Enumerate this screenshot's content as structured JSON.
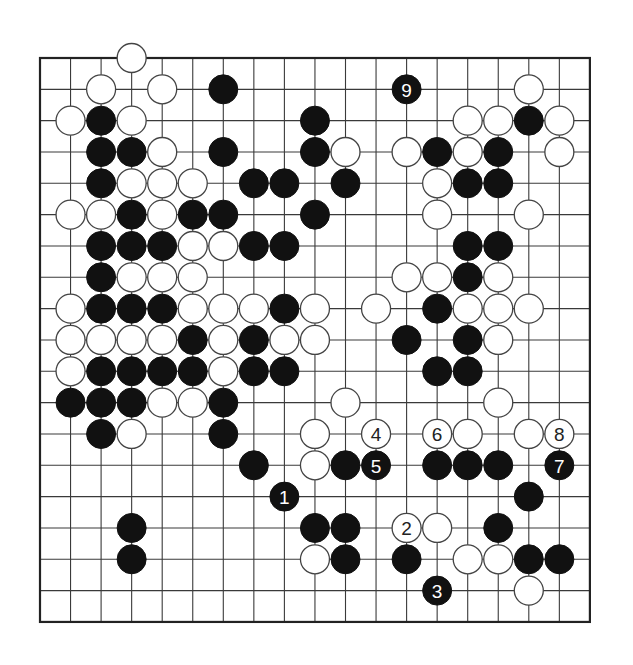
{
  "board": {
    "size": 19,
    "origin_x": 40,
    "origin_y": 58,
    "spacing_x": 30.55,
    "spacing_y": 31.33,
    "stone_radius": 14.5,
    "colors": {
      "black": "#111111",
      "white": "#ffffff",
      "line": "#3a3a3a"
    }
  },
  "stones": [
    {
      "row": 0,
      "col": 3,
      "color": "white"
    },
    {
      "row": 1,
      "col": 2,
      "color": "white"
    },
    {
      "row": 1,
      "col": 4,
      "color": "white"
    },
    {
      "row": 1,
      "col": 6,
      "color": "black"
    },
    {
      "row": 1,
      "col": 12,
      "color": "black",
      "label": "9"
    },
    {
      "row": 1,
      "col": 16,
      "color": "white"
    },
    {
      "row": 2,
      "col": 1,
      "color": "white"
    },
    {
      "row": 2,
      "col": 2,
      "color": "black"
    },
    {
      "row": 2,
      "col": 3,
      "color": "white"
    },
    {
      "row": 2,
      "col": 9,
      "color": "black"
    },
    {
      "row": 2,
      "col": 14,
      "color": "white"
    },
    {
      "row": 2,
      "col": 15,
      "color": "white"
    },
    {
      "row": 2,
      "col": 16,
      "color": "black"
    },
    {
      "row": 2,
      "col": 17,
      "color": "white"
    },
    {
      "row": 3,
      "col": 2,
      "color": "black"
    },
    {
      "row": 3,
      "col": 3,
      "color": "black"
    },
    {
      "row": 3,
      "col": 4,
      "color": "white"
    },
    {
      "row": 3,
      "col": 6,
      "color": "black"
    },
    {
      "row": 3,
      "col": 9,
      "color": "black"
    },
    {
      "row": 3,
      "col": 10,
      "color": "white"
    },
    {
      "row": 3,
      "col": 12,
      "color": "white"
    },
    {
      "row": 3,
      "col": 13,
      "color": "black"
    },
    {
      "row": 3,
      "col": 14,
      "color": "white"
    },
    {
      "row": 3,
      "col": 15,
      "color": "black"
    },
    {
      "row": 3,
      "col": 17,
      "color": "white"
    },
    {
      "row": 4,
      "col": 2,
      "color": "black"
    },
    {
      "row": 4,
      "col": 3,
      "color": "white"
    },
    {
      "row": 4,
      "col": 4,
      "color": "white"
    },
    {
      "row": 4,
      "col": 5,
      "color": "white"
    },
    {
      "row": 4,
      "col": 7,
      "color": "black"
    },
    {
      "row": 4,
      "col": 8,
      "color": "black"
    },
    {
      "row": 4,
      "col": 10,
      "color": "black"
    },
    {
      "row": 4,
      "col": 13,
      "color": "white"
    },
    {
      "row": 4,
      "col": 14,
      "color": "black"
    },
    {
      "row": 4,
      "col": 15,
      "color": "black"
    },
    {
      "row": 5,
      "col": 1,
      "color": "white"
    },
    {
      "row": 5,
      "col": 2,
      "color": "white"
    },
    {
      "row": 5,
      "col": 3,
      "color": "black"
    },
    {
      "row": 5,
      "col": 4,
      "color": "white"
    },
    {
      "row": 5,
      "col": 5,
      "color": "black"
    },
    {
      "row": 5,
      "col": 6,
      "color": "black"
    },
    {
      "row": 5,
      "col": 9,
      "color": "black"
    },
    {
      "row": 5,
      "col": 13,
      "color": "white"
    },
    {
      "row": 5,
      "col": 16,
      "color": "white"
    },
    {
      "row": 6,
      "col": 2,
      "color": "black"
    },
    {
      "row": 6,
      "col": 3,
      "color": "black"
    },
    {
      "row": 6,
      "col": 4,
      "color": "black"
    },
    {
      "row": 6,
      "col": 5,
      "color": "white"
    },
    {
      "row": 6,
      "col": 6,
      "color": "white"
    },
    {
      "row": 6,
      "col": 7,
      "color": "black"
    },
    {
      "row": 6,
      "col": 8,
      "color": "black"
    },
    {
      "row": 6,
      "col": 14,
      "color": "black"
    },
    {
      "row": 6,
      "col": 15,
      "color": "black"
    },
    {
      "row": 7,
      "col": 2,
      "color": "black"
    },
    {
      "row": 7,
      "col": 3,
      "color": "white"
    },
    {
      "row": 7,
      "col": 4,
      "color": "white"
    },
    {
      "row": 7,
      "col": 5,
      "color": "white"
    },
    {
      "row": 7,
      "col": 12,
      "color": "white"
    },
    {
      "row": 7,
      "col": 13,
      "color": "white"
    },
    {
      "row": 7,
      "col": 14,
      "color": "black"
    },
    {
      "row": 7,
      "col": 15,
      "color": "white"
    },
    {
      "row": 8,
      "col": 1,
      "color": "white"
    },
    {
      "row": 8,
      "col": 2,
      "color": "black"
    },
    {
      "row": 8,
      "col": 3,
      "color": "black"
    },
    {
      "row": 8,
      "col": 4,
      "color": "black"
    },
    {
      "row": 8,
      "col": 5,
      "color": "white"
    },
    {
      "row": 8,
      "col": 6,
      "color": "white"
    },
    {
      "row": 8,
      "col": 7,
      "color": "white"
    },
    {
      "row": 8,
      "col": 8,
      "color": "black"
    },
    {
      "row": 8,
      "col": 9,
      "color": "white"
    },
    {
      "row": 8,
      "col": 11,
      "color": "white"
    },
    {
      "row": 8,
      "col": 13,
      "color": "black"
    },
    {
      "row": 8,
      "col": 14,
      "color": "white"
    },
    {
      "row": 8,
      "col": 15,
      "color": "white"
    },
    {
      "row": 8,
      "col": 16,
      "color": "white"
    },
    {
      "row": 9,
      "col": 1,
      "color": "white"
    },
    {
      "row": 9,
      "col": 2,
      "color": "white"
    },
    {
      "row": 9,
      "col": 3,
      "color": "white"
    },
    {
      "row": 9,
      "col": 4,
      "color": "white"
    },
    {
      "row": 9,
      "col": 5,
      "color": "black"
    },
    {
      "row": 9,
      "col": 6,
      "color": "white"
    },
    {
      "row": 9,
      "col": 7,
      "color": "black"
    },
    {
      "row": 9,
      "col": 8,
      "color": "white"
    },
    {
      "row": 9,
      "col": 9,
      "color": "white"
    },
    {
      "row": 9,
      "col": 12,
      "color": "black"
    },
    {
      "row": 9,
      "col": 14,
      "color": "black"
    },
    {
      "row": 9,
      "col": 15,
      "color": "white"
    },
    {
      "row": 10,
      "col": 1,
      "color": "white"
    },
    {
      "row": 10,
      "col": 2,
      "color": "black"
    },
    {
      "row": 10,
      "col": 3,
      "color": "black"
    },
    {
      "row": 10,
      "col": 4,
      "color": "black"
    },
    {
      "row": 10,
      "col": 5,
      "color": "black"
    },
    {
      "row": 10,
      "col": 6,
      "color": "white"
    },
    {
      "row": 10,
      "col": 7,
      "color": "black"
    },
    {
      "row": 10,
      "col": 8,
      "color": "black"
    },
    {
      "row": 10,
      "col": 13,
      "color": "black"
    },
    {
      "row": 10,
      "col": 14,
      "color": "black"
    },
    {
      "row": 11,
      "col": 1,
      "color": "black"
    },
    {
      "row": 11,
      "col": 2,
      "color": "black"
    },
    {
      "row": 11,
      "col": 3,
      "color": "black"
    },
    {
      "row": 11,
      "col": 4,
      "color": "white"
    },
    {
      "row": 11,
      "col": 5,
      "color": "white"
    },
    {
      "row": 11,
      "col": 6,
      "color": "black"
    },
    {
      "row": 11,
      "col": 10,
      "color": "white"
    },
    {
      "row": 11,
      "col": 15,
      "color": "white"
    },
    {
      "row": 12,
      "col": 2,
      "color": "black"
    },
    {
      "row": 12,
      "col": 3,
      "color": "white"
    },
    {
      "row": 12,
      "col": 6,
      "color": "black"
    },
    {
      "row": 12,
      "col": 9,
      "color": "white"
    },
    {
      "row": 12,
      "col": 11,
      "color": "white",
      "label": "4"
    },
    {
      "row": 12,
      "col": 13,
      "color": "white",
      "label": "6"
    },
    {
      "row": 12,
      "col": 14,
      "color": "white"
    },
    {
      "row": 12,
      "col": 16,
      "color": "white"
    },
    {
      "row": 12,
      "col": 17,
      "color": "white",
      "label": "8"
    },
    {
      "row": 13,
      "col": 7,
      "color": "black"
    },
    {
      "row": 13,
      "col": 9,
      "color": "white"
    },
    {
      "row": 13,
      "col": 10,
      "color": "black"
    },
    {
      "row": 13,
      "col": 11,
      "color": "black",
      "label": "5"
    },
    {
      "row": 13,
      "col": 13,
      "color": "black"
    },
    {
      "row": 13,
      "col": 14,
      "color": "black"
    },
    {
      "row": 13,
      "col": 15,
      "color": "black"
    },
    {
      "row": 13,
      "col": 17,
      "color": "black",
      "label": "7"
    },
    {
      "row": 14,
      "col": 8,
      "color": "black",
      "label": "1"
    },
    {
      "row": 14,
      "col": 16,
      "color": "black"
    },
    {
      "row": 15,
      "col": 3,
      "color": "black"
    },
    {
      "row": 15,
      "col": 9,
      "color": "black"
    },
    {
      "row": 15,
      "col": 10,
      "color": "black"
    },
    {
      "row": 15,
      "col": 12,
      "color": "white",
      "label": "2"
    },
    {
      "row": 15,
      "col": 13,
      "color": "white"
    },
    {
      "row": 15,
      "col": 15,
      "color": "black"
    },
    {
      "row": 16,
      "col": 3,
      "color": "black"
    },
    {
      "row": 16,
      "col": 9,
      "color": "white"
    },
    {
      "row": 16,
      "col": 10,
      "color": "black"
    },
    {
      "row": 16,
      "col": 12,
      "color": "black"
    },
    {
      "row": 16,
      "col": 14,
      "color": "white"
    },
    {
      "row": 16,
      "col": 15,
      "color": "white"
    },
    {
      "row": 16,
      "col": 16,
      "color": "black"
    },
    {
      "row": 16,
      "col": 17,
      "color": "black"
    },
    {
      "row": 17,
      "col": 13,
      "color": "black",
      "label": "3"
    },
    {
      "row": 17,
      "col": 16,
      "color": "white"
    }
  ],
  "move_sequence": [
    "1",
    "2",
    "3",
    "4",
    "5",
    "6",
    "7",
    "8",
    "9"
  ]
}
